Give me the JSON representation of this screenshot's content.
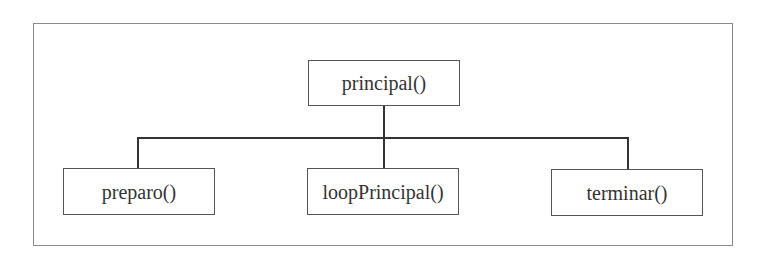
{
  "diagram": {
    "type": "hierarchy",
    "root": {
      "id": "principal",
      "label": "principal()"
    },
    "children": [
      {
        "id": "preparo",
        "label": "preparo()"
      },
      {
        "id": "loopPrincipal",
        "label": "loopPrincipal()"
      },
      {
        "id": "terminar",
        "label": "terminar()"
      }
    ],
    "edges": [
      {
        "from": "principal()",
        "to": "preparo()"
      },
      {
        "from": "principal()",
        "to": "loopPrincipal()"
      },
      {
        "from": "principal()",
        "to": "terminar()"
      }
    ],
    "colors": {
      "frame_border": "#8a8a8a",
      "node_border": "#555555",
      "connector": "#333333",
      "text": "#333333",
      "background": "#ffffff"
    }
  }
}
